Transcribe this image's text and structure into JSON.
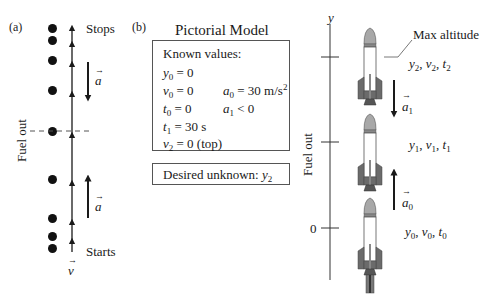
{
  "panel_a": {
    "label": "(a)",
    "stops_label": "Stops",
    "starts_label": "Starts",
    "fuel_out_label": "Fuel out",
    "accel_label": "a",
    "velocity_label": "v",
    "dot_y_positions": [
      28,
      40,
      60,
      90,
      131,
      179,
      218,
      236,
      248
    ]
  },
  "panel_b": {
    "label": "(b)",
    "title": "Pictorial Model",
    "known_values": {
      "heading": "Known values:",
      "y0": {
        "var": "y",
        "sub": "0",
        "rest": " = 0"
      },
      "v0": {
        "var": "v",
        "sub": "0",
        "rest": " = 0"
      },
      "t0": {
        "var": "t",
        "sub": "0",
        "rest": " = 0"
      },
      "t1": {
        "var": "t",
        "sub": "1",
        "rest": " = 30 s"
      },
      "v2": {
        "var": "v",
        "sub": "2",
        "rest": " = 0  (top)"
      },
      "a0": {
        "var": "a",
        "sub": "0",
        "rest": " = 30 m/s",
        "sup": "2"
      },
      "a1": {
        "var": "a",
        "sub": "1",
        "rest": " < 0"
      }
    },
    "desired_unknown": {
      "text": "Desired unknown: ",
      "var": "y",
      "sub": "2"
    }
  },
  "panel_c": {
    "axis_label": "y",
    "zero_label": "0",
    "fuel_out_label": "Fuel out",
    "max_altitude_label": "Max altitude",
    "points": [
      {
        "label": "y2, v2, t2",
        "vars": [
          "y",
          "v",
          "t"
        ],
        "sub": "2"
      },
      {
        "label": "y1, v1, t1",
        "vars": [
          "y",
          "v",
          "t"
        ],
        "sub": "1"
      },
      {
        "label": "y0, v0, t0",
        "vars": [
          "y",
          "v",
          "t"
        ],
        "sub": "0"
      }
    ],
    "accel_a1": {
      "var": "a",
      "sub": "1",
      "direction": "down"
    },
    "accel_a0": {
      "var": "a",
      "sub": "0",
      "direction": "up"
    }
  },
  "colors": {
    "ink": "#1a1a1a",
    "rocket_nose": "#a8a8a8",
    "rocket_fin": "#6b6b6b",
    "rocket_body": "#ffffff",
    "box_border": "#555555"
  }
}
